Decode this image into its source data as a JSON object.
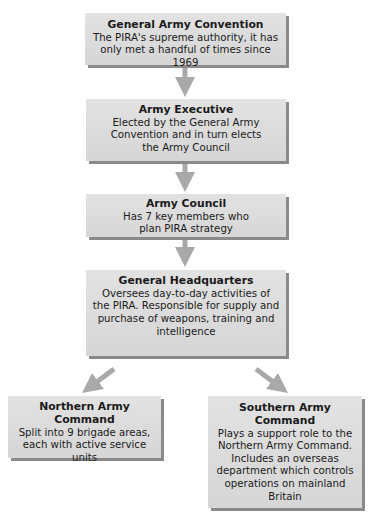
{
  "diagram": {
    "type": "org-chart",
    "colors": {
      "box_fill": "#dcdcdc",
      "box_shadow": "#8a8a8a",
      "arrow": "#a9a9a9",
      "text": "#1a1a1a"
    },
    "nodes": [
      {
        "id": "general-army-convention",
        "title": "General Army Convention",
        "description": "The PIRA's supreme authority, it has only met a handful of times since 1969"
      },
      {
        "id": "army-executive",
        "title": "Army Executive",
        "description": "Elected by the General Army Convention and in turn elects the Army Council"
      },
      {
        "id": "army-council",
        "title": "Army Council",
        "description": "Has 7 key members who plan PIRA strategy"
      },
      {
        "id": "general-headquarters",
        "title": "General Headquarters",
        "description": "Oversees day-to-day activities of the PIRA. Responsible for supply and purchase of weapons, training and intelligence"
      },
      {
        "id": "northern-army-command",
        "title": "Northern Army Command",
        "description": "Split into 9 brigade areas, each with active service units"
      },
      {
        "id": "southern-army-command",
        "title": "Southern Army Command",
        "description": "Plays a support role to the Northern Army Command. Includes an overseas department which controls operations on mainland Britain"
      }
    ],
    "edges": [
      {
        "from": "general-army-convention",
        "to": "army-executive"
      },
      {
        "from": "army-executive",
        "to": "army-council"
      },
      {
        "from": "army-council",
        "to": "general-headquarters"
      },
      {
        "from": "general-headquarters",
        "to": "northern-army-command"
      },
      {
        "from": "general-headquarters",
        "to": "southern-army-command"
      }
    ]
  }
}
